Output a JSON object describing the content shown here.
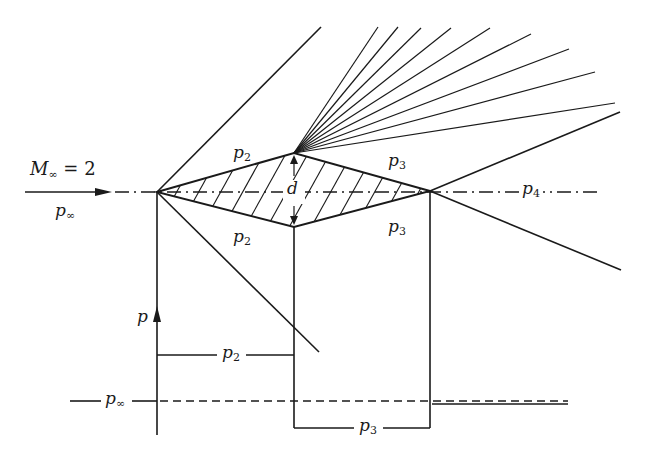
{
  "diagram": {
    "labels": {
      "mach": {
        "base": "M",
        "sub": "∞",
        "rest": " = 2"
      },
      "p_inf_flow": {
        "base": "p",
        "sub": "∞"
      },
      "p2_upper": {
        "base": "p",
        "sub": "2"
      },
      "p2_lower": {
        "base": "p",
        "sub": "2"
      },
      "p3_upper": {
        "base": "p",
        "sub": "3"
      },
      "p3_lower": {
        "base": "p",
        "sub": "3"
      },
      "p4": {
        "base": "p",
        "sub": "4"
      },
      "thickness": {
        "base": "d",
        "sub": ""
      },
      "p_axis": {
        "base": "p",
        "sub": ""
      },
      "p2_plot": {
        "base": "p",
        "sub": "2"
      },
      "p_inf_plot": {
        "base": "p",
        "sub": "∞"
      },
      "p3_plot": {
        "base": "p",
        "sub": "3"
      }
    },
    "elements": [
      "freestream-arrow",
      "oblique-shock-leading-upper",
      "oblique-shock-leading-lower",
      "expansion-fan",
      "oblique-shock-trailing-upper",
      "oblique-shock-trailing-lower",
      "diamond-airfoil",
      "centerline",
      "pressure-distribution-plot"
    ],
    "geometry": {
      "leading_edge": [
        157,
        192
      ],
      "top_vertex": [
        294,
        153
      ],
      "bottom_vertex": [
        294,
        227
      ],
      "trailing_edge": [
        430,
        191
      ]
    }
  }
}
